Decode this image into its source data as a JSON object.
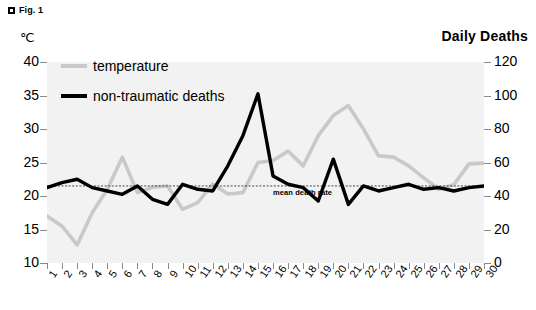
{
  "figure": {
    "marker_label": "Fig. 1",
    "left_axis_unit": "℃",
    "right_axis_title": "Daily Deaths"
  },
  "legend": {
    "temperature_label": "temperature",
    "deaths_label": "non-traumatic deaths"
  },
  "annotation": {
    "mean_death_rate": "mean death rate"
  },
  "colors": {
    "temperature_line": "#c9c9c9",
    "deaths_line": "#000000",
    "plot_background": "#f2f2f2",
    "axis": "#8a8a8a",
    "mean_line": "#333333"
  },
  "chart_data": {
    "type": "line",
    "title": "",
    "subtitle": "",
    "xlabel": "",
    "ylabel": "℃",
    "y2label": "Daily Deaths",
    "grid": false,
    "legend_position": "inside-top-left",
    "x": [
      1,
      2,
      3,
      4,
      5,
      6,
      7,
      8,
      9,
      10,
      11,
      12,
      13,
      14,
      15,
      16,
      17,
      18,
      19,
      20,
      21,
      22,
      23,
      24,
      25,
      26,
      27,
      28,
      29,
      30
    ],
    "xticklabels": [
      "1",
      "2",
      "3",
      "4",
      "5",
      "6",
      "7",
      "8",
      "9",
      "10",
      "11",
      "12",
      "13",
      "14",
      "15",
      "16",
      "17",
      "18",
      "19",
      "20",
      "21",
      "22",
      "23",
      "24",
      "25",
      "26",
      "27",
      "28",
      "29",
      "30"
    ],
    "ylim": [
      10,
      40
    ],
    "yticks": [
      10,
      15,
      20,
      25,
      30,
      35,
      40
    ],
    "yticklabels": [
      "10",
      "15",
      "20",
      "25",
      "30",
      "35",
      "40"
    ],
    "y2lim": [
      0,
      120
    ],
    "y2ticks": [
      0,
      20,
      40,
      60,
      80,
      100,
      120
    ],
    "y2ticklabels": [
      "0",
      "20",
      "40",
      "60",
      "80",
      "100",
      "120"
    ],
    "series": [
      {
        "name": "temperature",
        "axis": "left",
        "unit": "℃",
        "color": "#c9c9c9",
        "values": [
          17.0,
          15.5,
          12.7,
          17.5,
          21.0,
          25.8,
          20.5,
          21.3,
          21.5,
          18.0,
          19.0,
          21.8,
          20.3,
          20.5,
          25.0,
          25.3,
          26.7,
          24.5,
          29.0,
          32.0,
          33.5,
          30.0,
          26.0,
          25.8,
          24.5,
          22.7,
          21.0,
          21.7,
          24.8,
          24.9
        ]
      },
      {
        "name": "non-traumatic deaths",
        "axis": "right",
        "unit": "deaths/day",
        "color": "#000000",
        "values_deaths": [
          45,
          48,
          50,
          45,
          43,
          42,
          41,
          43,
          46,
          40,
          38,
          40,
          36,
          35,
          47,
          45,
          44,
          44,
          43,
          58,
          76,
          101,
          83,
          52,
          47,
          45,
          37,
          50,
          62,
          35,
          46,
          43,
          40,
          45,
          45,
          47
        ],
        "values": [
          45,
          48,
          50,
          45,
          43,
          41,
          46,
          38,
          35,
          47,
          44,
          43,
          58,
          76,
          101,
          52,
          47,
          45,
          37,
          62,
          35,
          46,
          43,
          45,
          47,
          44,
          45,
          43,
          45,
          46
        ]
      }
    ],
    "reference_line": {
      "label": "mean death rate",
      "axis": "right",
      "value": 46
    }
  }
}
